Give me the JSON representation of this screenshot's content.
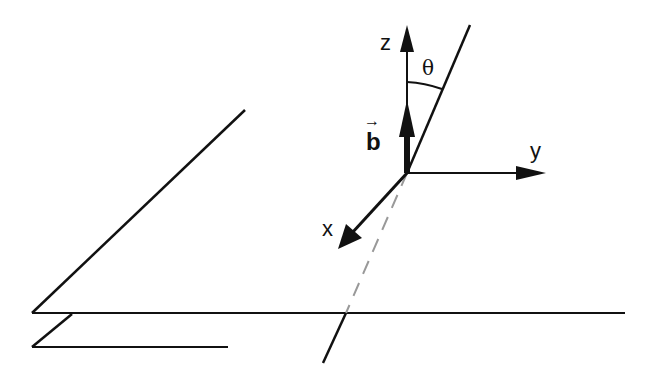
{
  "diagram": {
    "type": "3d-coordinate-axes-with-tilted-line",
    "labels": {
      "z_axis": "z",
      "y_axis": "y",
      "x_axis": "x",
      "angle": "θ",
      "vector": "b",
      "vector_arrow": "→"
    },
    "colors": {
      "stroke": "#111111",
      "dashed": "#999999",
      "background": "#ffffff"
    }
  }
}
